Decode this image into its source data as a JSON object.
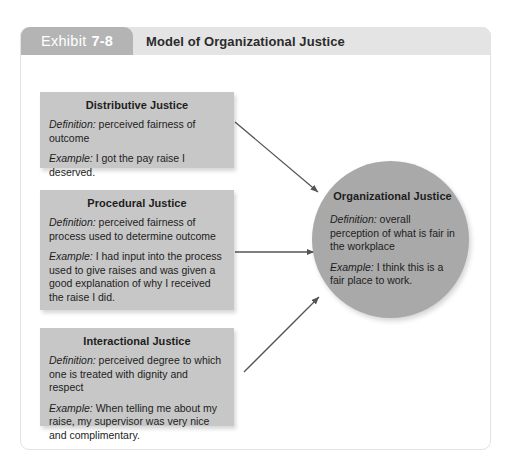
{
  "header": {
    "exhibit_word": "Exhibit",
    "exhibit_number": "7-8",
    "title": "Model of Organizational Justice",
    "tab_color": "#b4b4b4",
    "bar_color": "#e4e4e4"
  },
  "diagram": {
    "box_color": "#c7c7c7",
    "circle_color": "#a9a9a9",
    "arrow_color": "#545454",
    "definition_label": "Definition:",
    "example_label": "Example:",
    "boxes": [
      {
        "id": "distributive-justice",
        "title": "Distributive Justice",
        "definition": " perceived fairness of outcome",
        "example": " I got the pay raise I deserved."
      },
      {
        "id": "procedural-justice",
        "title": "Procedural Justice",
        "definition": " perceived fairness of process used to determine outcome",
        "example": " I had input into the process used to give raises and was given a good explanation of why I received the raise I did."
      },
      {
        "id": "interactional-justice",
        "title": "Interactional Justice",
        "definition": " perceived degree to which one is treated with dignity and respect",
        "example": " When telling me about my raise, my supervisor was very nice and complimentary."
      }
    ],
    "outcome": {
      "id": "organizational-justice",
      "title": "Organizational Justice",
      "definition": " overall perception of what is fair in the workplace",
      "example": " I think this is a fair place to work."
    },
    "arrows": [
      {
        "id": "distributive-to-organizational",
        "from": "distributive-justice",
        "to": "organizational-justice"
      },
      {
        "id": "procedural-to-organizational",
        "from": "procedural-justice",
        "to": "organizational-justice"
      },
      {
        "id": "interactional-to-organizational",
        "from": "interactional-justice",
        "to": "organizational-justice"
      }
    ]
  }
}
